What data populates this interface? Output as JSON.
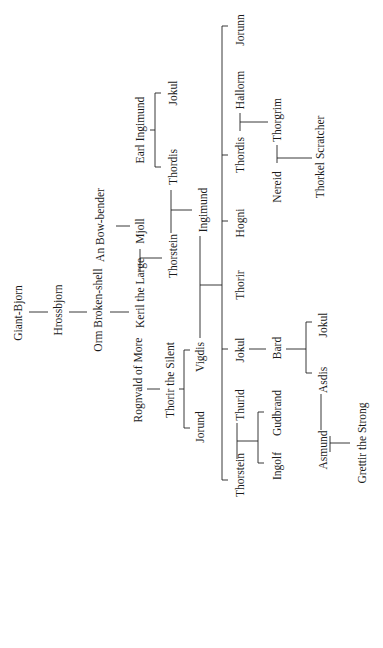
{
  "orientation": "rotated -90 degrees",
  "people": [
    {
      "id": "giant-bjorn",
      "name": "Giant-Bjorn",
      "x": 18,
      "y": 313
    },
    {
      "id": "hrossbjorn",
      "name": "Hrossbjorn",
      "x": 58,
      "y": 310
    },
    {
      "id": "orm-broken-shell",
      "name": "Orm Broken-shell",
      "x": 98,
      "y": 310
    },
    {
      "id": "an-bow-bender",
      "name": "An Bow-bender",
      "x": 100,
      "y": 225
    },
    {
      "id": "keril-the-large",
      "name": "Keril the Large",
      "x": 140,
      "y": 293
    },
    {
      "id": "mjoll",
      "name": "Mjoll",
      "x": 140,
      "y": 231
    },
    {
      "id": "earl-ingimund",
      "name": "Earl Ingimund",
      "x": 140,
      "y": 130
    },
    {
      "id": "jokul-earl",
      "name": "Jokul",
      "x": 173,
      "y": 93
    },
    {
      "id": "thordis-earl",
      "name": "Thordis",
      "x": 173,
      "y": 167
    },
    {
      "id": "thorstein-keril",
      "name": "Thorstein",
      "x": 173,
      "y": 256
    },
    {
      "id": "ingimund",
      "name": "Ingimund",
      "x": 203,
      "y": 210
    },
    {
      "id": "rognvald-of-more",
      "name": "Rognvald of More",
      "x": 138,
      "y": 380
    },
    {
      "id": "thorir-the-silent",
      "name": "Thorir the Silent",
      "x": 170,
      "y": 380
    },
    {
      "id": "vigdis",
      "name": "Vigdis",
      "x": 200,
      "y": 357
    },
    {
      "id": "jorund",
      "name": "Jorund",
      "x": 200,
      "y": 427
    },
    {
      "id": "jorunn",
      "name": "Jorunn",
      "x": 240,
      "y": 30
    },
    {
      "id": "hallorm",
      "name": "Hallorm",
      "x": 240,
      "y": 90
    },
    {
      "id": "thordis",
      "name": "Thordis",
      "x": 240,
      "y": 155
    },
    {
      "id": "hogni",
      "name": "Hogni",
      "x": 240,
      "y": 223
    },
    {
      "id": "thorir",
      "name": "Thorir",
      "x": 240,
      "y": 285
    },
    {
      "id": "jokul",
      "name": "Jokul",
      "x": 240,
      "y": 350
    },
    {
      "id": "thurid",
      "name": "Thurid",
      "x": 240,
      "y": 405
    },
    {
      "id": "thorstein",
      "name": "Thorstein",
      "x": 240,
      "y": 475
    },
    {
      "id": "thorgrim",
      "name": "Thorgrim",
      "x": 277,
      "y": 120
    },
    {
      "id": "nereid",
      "name": "Nereid",
      "x": 277,
      "y": 187
    },
    {
      "id": "bard",
      "name": "Bard",
      "x": 277,
      "y": 348
    },
    {
      "id": "gudbrand",
      "name": "Gudbrand",
      "x": 277,
      "y": 413
    },
    {
      "id": "ingolf",
      "name": "Ingolf",
      "x": 277,
      "y": 466
    },
    {
      "id": "thorkel-scratcher",
      "name": "Thorkel Scratcher",
      "x": 320,
      "y": 157
    },
    {
      "id": "jokul-bard",
      "name": "Jokul",
      "x": 323,
      "y": 325
    },
    {
      "id": "asdis",
      "name": "Asdis",
      "x": 323,
      "y": 380
    },
    {
      "id": "asmund",
      "name": "Asmund",
      "x": 323,
      "y": 450
    },
    {
      "id": "grettir-the-strong",
      "name": "Grettir the Strong",
      "x": 362,
      "y": 443
    }
  ],
  "lines": [
    [
      29,
      312,
      47,
      312
    ],
    [
      69,
      312,
      87,
      312
    ],
    [
      109,
      312,
      129,
      312
    ],
    [
      117,
      220,
      117,
      232
    ],
    [
      140,
      248,
      140,
      272
    ],
    [
      140,
      250,
      140,
      250
    ],
    [
      140,
      258,
      162,
      258
    ],
    [
      140,
      248,
      140,
      270
    ],
    [
      155,
      165,
      155,
      130
    ],
    [
      155,
      130,
      155,
      98
    ],
    [
      155,
      98,
      160,
      98
    ],
    [
      155,
      165,
      160,
      165
    ],
    [
      150,
      130,
      155,
      130
    ],
    [
      170,
      190,
      170,
      194
    ],
    [
      170,
      210,
      192,
      210
    ],
    [
      171,
      195,
      171,
      225
    ],
    [
      200,
      235,
      200,
      337
    ],
    [
      200,
      285,
      230,
      285
    ],
    [
      148,
      389,
      160,
      389
    ],
    [
      180,
      389,
      184,
      389
    ],
    [
      184,
      350,
      184,
      428
    ],
    [
      184,
      350,
      190,
      350
    ],
    [
      184,
      428,
      190,
      428
    ],
    [
      222,
      26,
      222,
      480
    ],
    [
      222,
      26,
      228,
      26
    ],
    [
      222,
      155,
      228,
      155
    ],
    [
      222,
      223,
      228,
      223
    ],
    [
      222,
      285,
      228,
      285
    ],
    [
      222,
      350,
      228,
      350
    ],
    [
      222,
      480,
      228,
      480
    ],
    [
      240,
      118,
      240,
      110
    ],
    [
      239,
      122,
      268,
      122
    ],
    [
      275,
      157,
      275,
      160
    ],
    [
      275,
      158,
      312,
      158
    ],
    [
      248,
      348,
      262,
      348
    ],
    [
      284,
      348,
      306,
      348
    ],
    [
      306,
      318,
      306,
      372
    ],
    [
      306,
      318,
      312,
      318
    ],
    [
      306,
      372,
      312,
      372
    ],
    [
      236,
      425,
      258,
      425
    ],
    [
      258,
      412,
      258,
      462
    ],
    [
      258,
      412,
      264,
      412
    ],
    [
      258,
      462,
      264,
      462
    ],
    [
      323,
      393,
      323,
      428
    ],
    [
      330,
      443,
      350,
      443
    ]
  ]
}
